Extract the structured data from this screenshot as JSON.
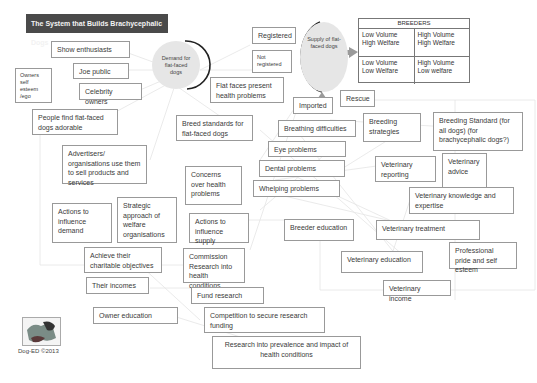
{
  "title": "The System that Builds Brachycephalic Dogs",
  "nodes": {
    "demand": "Demand for flat-faced dogs",
    "supply": "Supply of flat-faced dogs"
  },
  "breeders": {
    "header": "BREEDERS",
    "cells": [
      [
        "Low Volume High Welfare",
        "High Volume High Welfare"
      ],
      [
        "Low Volume Low Welfare",
        "High Volume Low welfare"
      ]
    ]
  },
  "boxes": {
    "show_enthusiasts": "Show enthusiasts",
    "joe_public": "Joe public",
    "owners_self_esteem": "Owners self esteem /ego",
    "celebrity_owners": "Celebrity owners",
    "people_find_adorable": "People find flat-faced dogs adorable",
    "advertisers": "Advertisers/ organisations use them to sell products and services",
    "actions_influence_demand": "Actions to influence demand",
    "strategic_approach": "Strategic approach of welfare organisations",
    "achieve_objectives": "Achieve their charitable objectives",
    "their_incomes": "Their incomes",
    "owner_education": "Owner education",
    "registered": "Registered",
    "not_registered": "Not registered",
    "flat_faces_health": "Flat faces present health problems",
    "imported": "Imported",
    "rescue": "Rescue",
    "breed_standards": "Breed standards for flat-faced dogs",
    "breathing": "Breathing difficulties",
    "eye": "Eye problems",
    "dental": "Dental problems",
    "whelping": "Whelping problems",
    "concerns_health": "Concerns over health problems",
    "actions_influence_supply": "Actions to influence supply",
    "commission_research": "Commission Research into health conditions",
    "fund_research": "Fund research",
    "competition_funding": "Competition to secure research funding",
    "research_prevalence": "Research into prevalence and impact of health conditions",
    "breeding_strategies": "Breeding strategies",
    "breeding_standard_all": "Breeding Standard (for all dogs) (for brachycephalic dogs?)",
    "vet_reporting": "Veterinary reporting",
    "vet_advice": "Veterinary advice",
    "vet_knowledge": "Veterinary knowledge and expertise",
    "breeder_education": "Breeder education",
    "vet_treatment": "Veterinary treatment",
    "professional_pride": "Professional pride and self esteem",
    "vet_education": "Veterinary education",
    "vet_income": "Veterinary income"
  },
  "footer": {
    "logo_caption": "Dog-ED ©2013"
  },
  "colors": {
    "title_bg": "#4a4a4a",
    "circle_fill": "#e6e6e6",
    "box_border": "#999999",
    "arrow": "#9a9a9a"
  }
}
